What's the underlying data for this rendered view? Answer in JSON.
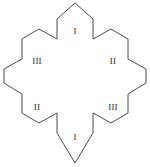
{
  "figure": {
    "shape_name": "six-pointed-star-hexagonal-arms",
    "stroke_color": "#4a4a4a",
    "fill_color": "#ffffff",
    "background_color": "#ffffff",
    "stroke_width": 1,
    "outline_points": "75,3 93,19 93,39 111,29 128,39 128,59 146,69 146,83 128,94 128,113 111,123 93,113 93,133 75,163 57,133 57,113 39,123 22,113 22,94 4,83 4,69 22,59 22,39 39,29 57,39 57,19",
    "labels": [
      {
        "id": "top",
        "text": "I",
        "x": 75,
        "y": 31
      },
      {
        "id": "upper-right",
        "text": "II",
        "x": 113,
        "y": 61
      },
      {
        "id": "lower-right",
        "text": "III",
        "x": 113,
        "y": 107
      },
      {
        "id": "bottom",
        "text": "I",
        "x": 75,
        "y": 137
      },
      {
        "id": "lower-left",
        "text": "II",
        "x": 37,
        "y": 107
      },
      {
        "id": "upper-left",
        "text": "III",
        "x": 37,
        "y": 61
      }
    ]
  }
}
